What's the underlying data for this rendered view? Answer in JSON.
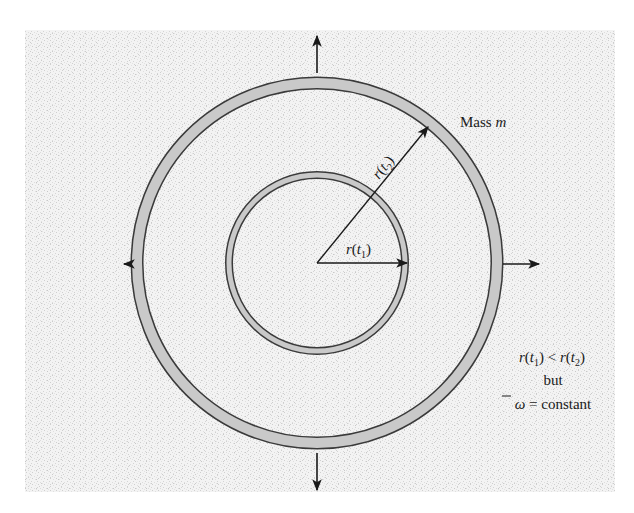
{
  "figure": {
    "background": {
      "color": "#f2f2f2",
      "speckle_color": "#d6d6d6",
      "x": 25,
      "y": 30,
      "width": 590,
      "height": 462
    },
    "center": {
      "x": 317,
      "y": 263
    },
    "outer_ring": {
      "radius": 180,
      "thickness": 12,
      "fill": "#c9c9c9",
      "stroke": "#3a3a3a"
    },
    "inner_ring": {
      "radius": 88,
      "thickness": 7,
      "fill": "#c9c9c9",
      "stroke": "#3a3a3a"
    },
    "expansion_arrows": [
      {
        "direction": "up",
        "x1": 317,
        "y1": 73,
        "x2": 317,
        "y2": 34
      },
      {
        "direction": "down",
        "x1": 317,
        "y1": 453,
        "x2": 317,
        "y2": 492
      },
      {
        "direction": "left",
        "x1": 132,
        "y1": 264,
        "x2": 123,
        "y2": 264
      },
      {
        "direction": "right",
        "x1": 503,
        "y1": 264,
        "x2": 540,
        "y2": 264
      }
    ],
    "radius_arrows": [
      {
        "name": "r-t1",
        "x1": 317,
        "y1": 263,
        "x2": 405,
        "y2": 263
      },
      {
        "name": "r-t2",
        "x1": 317,
        "y1": 263,
        "x2": 428,
        "y2": 127
      }
    ],
    "labels": {
      "mass": {
        "prefix": "Mass ",
        "variable": "m"
      },
      "r_t1": {
        "r": "r",
        "open": "(",
        "t": "t",
        "sub": "1",
        "close": ")"
      },
      "r_t2": {
        "r": "r",
        "open": "(",
        "t": "t",
        "sub": "2",
        "close": ")"
      },
      "condition": {
        "line1": {
          "lhs_r": "r",
          "lhs_t": "t",
          "lhs_sub": "1",
          "op": " < ",
          "rhs_r": "r",
          "rhs_t": "t",
          "rhs_sub": "2"
        },
        "line2": "but",
        "line3": {
          "symbol": "ω",
          "rest": " = constant"
        }
      }
    }
  }
}
